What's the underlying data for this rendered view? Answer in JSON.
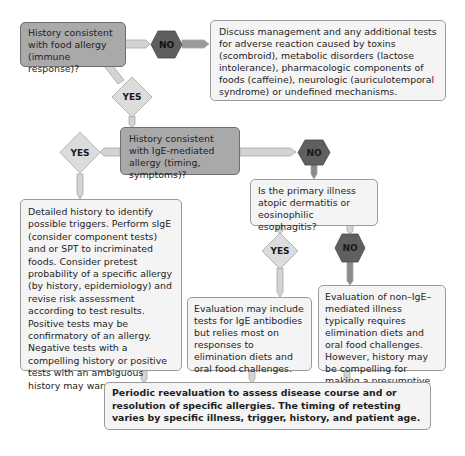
{
  "colors": {
    "question_box": "#a9a9a9",
    "info_box": "#f4f4f4",
    "yes_diamond": "#d9d9d9",
    "no_hexagon": "#5f5f5f",
    "connector_light": "#d0d0d0",
    "connector_dark": "#8a8a8a",
    "border": "#9a9a9a"
  },
  "nodes": {
    "q1": "History consistent with food allergy (immune response)?",
    "no1": "NO",
    "outcome_non_immune": "Discuss management and any additional tests for adverse reaction caused by toxins (scombroid), metabolic disorders (lactose intolerance), pharmacologic components of foods (caffeine), neurologic (auriculotemporal syndrome) or undefined mechanisms.",
    "yes1": "YES",
    "q2": "History consistent with IgE-mediated allergy (timing, symptoms)?",
    "yes2": "YES",
    "no2": "NO",
    "q3": "Is the primary illness atopic dermatitis or eosinophilic esophagitis?",
    "outcome_ige": "Detailed history to identify possible triggers. Perform sIgE (consider component tests) and or SPT to incriminated foods.  Consider pretest probability of a specific allergy (by history, epidemiology) and revise risk assessment according to test results.  Positive tests may be confirmatory of an allergy. Negative tests with a compelling history or positive tests with an ambiguous history may warrant an OFC.",
    "yes3": "YES",
    "no3": "NO",
    "outcome_atopic": "Evaluation may include tests for IgE antibodies but relies most on responses to elimination diets and oral food challenges.",
    "outcome_non_ige": "Evaluation of non–IgE–mediated illness typically requires elimination diets and oral food challenges. However, history may be compelling for making a presumptive diagnosis.",
    "final": "Periodic reevaluation to assess disease course and or resolution of specific allergies. The timing of retesting varies by specific illness, trigger, history, and patient age."
  }
}
